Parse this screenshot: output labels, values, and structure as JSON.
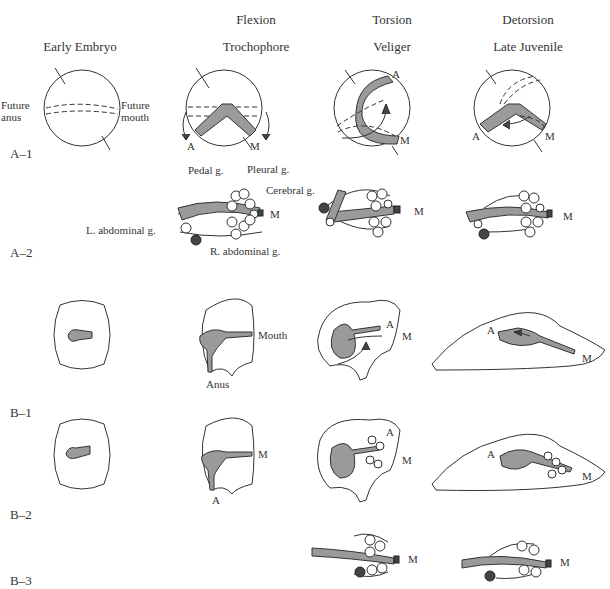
{
  "figure": {
    "stage_headers": [
      {
        "process": "",
        "stage": "Early Embryo"
      },
      {
        "process": "Flexion",
        "stage": "Trochophore"
      },
      {
        "process": "Torsion",
        "stage": "Veliger"
      },
      {
        "process": "Detorsion",
        "stage": "Late Juvenile"
      }
    ],
    "row_labels": [
      "A–1",
      "A–2",
      "B–1",
      "B–2",
      "B–3"
    ],
    "a1_labels": {
      "future_anus": "Future\nanus",
      "future_anus_1": "Future",
      "future_anus_2": "anus",
      "future_mouth_1": "Future",
      "future_mouth_2": "mouth",
      "anus_abbr": "A",
      "mouth_abbr": "M"
    },
    "a2_labels": {
      "pedal": "Pedal g.",
      "pleural": "Pleural g.",
      "cerebral": "Cerebral g.",
      "l_abdominal": "L. abdominal g.",
      "r_abdominal": "R. abdominal g.",
      "mouth_abbr": "M"
    },
    "b1_labels": {
      "mouth": "Mouth",
      "anus": "Anus",
      "anus_abbr": "A",
      "mouth_abbr": "M"
    },
    "b2_labels": {
      "anus_abbr": "A",
      "mouth_abbr": "M"
    },
    "b3_labels": {
      "mouth_abbr": "M"
    },
    "colors": {
      "gut_fill": "#9a9a9a",
      "ganglion_dark": "#444444",
      "outline": "#333333"
    }
  }
}
